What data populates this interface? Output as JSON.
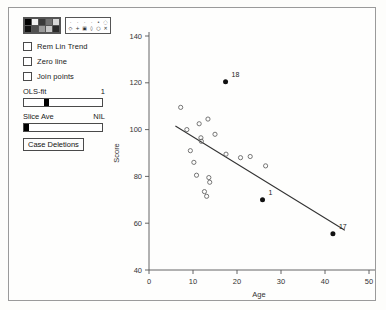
{
  "panel": {
    "color_palette": {
      "name": "color-palette",
      "swatches": [
        "#000000",
        "#f2f2f2",
        "#3a3a3a",
        "#707070",
        "#d8d8d8",
        "#111111",
        "#505050",
        "#9a9a9a",
        "#c8c8c8",
        "#2a2a2a"
      ]
    },
    "symbol_palette": {
      "name": "symbol-palette",
      "row1": [
        "·",
        "·",
        "·",
        "·",
        "•",
        "◌"
      ],
      "row2": [
        "◇",
        "+",
        "▣",
        "◊",
        "○",
        "✕"
      ]
    },
    "checkboxes": [
      {
        "label": "Rem Lin Trend",
        "checked": false
      },
      {
        "label": "Zero line",
        "checked": false
      },
      {
        "label": "Join points",
        "checked": false
      }
    ],
    "sliders": [
      {
        "label": "OLS-fit",
        "value": "1",
        "knob_pct": 28
      },
      {
        "label": "Slice Ave",
        "value": "NIL",
        "knob_pct": 0
      }
    ],
    "button": {
      "label": "Case Deletions"
    }
  },
  "chart_data": {
    "type": "scatter",
    "title": "",
    "xlabel": "Age",
    "ylabel": "Score",
    "xlim": [
      0,
      50
    ],
    "ylim": [
      40,
      140
    ],
    "xticks": [
      0,
      10,
      20,
      30,
      40,
      50
    ],
    "yticks": [
      40,
      60,
      80,
      100,
      120,
      140
    ],
    "grid": false,
    "legend": "none",
    "points": [
      {
        "x": 7.2,
        "y": 109.5,
        "marker": "open"
      },
      {
        "x": 8.6,
        "y": 100.0,
        "marker": "open"
      },
      {
        "x": 9.4,
        "y": 91.0,
        "marker": "open"
      },
      {
        "x": 10.2,
        "y": 86.0,
        "marker": "open"
      },
      {
        "x": 10.8,
        "y": 80.5,
        "marker": "open"
      },
      {
        "x": 11.4,
        "y": 102.5,
        "marker": "open"
      },
      {
        "x": 11.8,
        "y": 96.5,
        "marker": "open"
      },
      {
        "x": 11.9,
        "y": 95.0,
        "marker": "open"
      },
      {
        "x": 12.6,
        "y": 73.5,
        "marker": "open"
      },
      {
        "x": 13.1,
        "y": 71.5,
        "marker": "open"
      },
      {
        "x": 13.4,
        "y": 104.5,
        "marker": "open"
      },
      {
        "x": 13.6,
        "y": 79.5,
        "marker": "open"
      },
      {
        "x": 13.8,
        "y": 77.5,
        "marker": "open"
      },
      {
        "x": 15.0,
        "y": 98.0,
        "marker": "open"
      },
      {
        "x": 17.5,
        "y": 89.5,
        "marker": "open"
      },
      {
        "x": 20.8,
        "y": 88.0,
        "marker": "open"
      },
      {
        "x": 23.0,
        "y": 88.5,
        "marker": "open"
      },
      {
        "x": 26.5,
        "y": 84.5,
        "marker": "open"
      },
      {
        "x": 17.4,
        "y": 120.5,
        "marker": "filled",
        "label": "18"
      },
      {
        "x": 25.8,
        "y": 70.0,
        "marker": "filled",
        "label": "1"
      },
      {
        "x": 41.8,
        "y": 55.5,
        "marker": "filled",
        "label": "17"
      }
    ],
    "fit_line": {
      "name": "ols-fit-line",
      "x1": 6.0,
      "y1": 101.5,
      "x2": 44.5,
      "y2": 57.0
    }
  }
}
